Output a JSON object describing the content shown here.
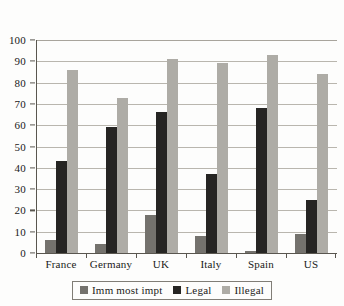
{
  "chart_data": {
    "type": "bar",
    "title": "",
    "subtitle": "",
    "xlabel": "",
    "ylabel": "",
    "categories": [
      "France",
      "Germany",
      "UK",
      "Italy",
      "Spain",
      "US"
    ],
    "series": [
      {
        "name": "Imm most impt",
        "color": "#74726d",
        "values": [
          6,
          4,
          18,
          8,
          1,
          9
        ]
      },
      {
        "name": "Legal",
        "color": "#262523",
        "values": [
          43,
          59,
          66,
          37,
          68,
          25
        ]
      },
      {
        "name": "Illegal",
        "color": "#aeaca6",
        "values": [
          86,
          73,
          91,
          89,
          93,
          84
        ]
      }
    ],
    "ylim": [
      0,
      100
    ],
    "yticks": [
      0,
      10,
      20,
      30,
      40,
      50,
      60,
      70,
      80,
      90,
      100
    ],
    "ytick_labels": [
      "0",
      "10",
      "20",
      "30",
      "40",
      "50",
      "60",
      "70",
      "80",
      "90",
      "100"
    ],
    "grid": true,
    "grid_axis": "y",
    "legend_position": "bottom-center",
    "bar_group_order": [
      "Imm most impt",
      "Legal",
      "Illegal"
    ]
  },
  "legend": {
    "items": [
      {
        "label": "Imm most impt"
      },
      {
        "label": "Legal"
      },
      {
        "label": "Illegal"
      }
    ]
  },
  "colors": {
    "series_imm_most_impt": "#74726d",
    "series_legal": "#262523",
    "series_illegal": "#aeaca6",
    "axis": "#59564f",
    "grid": "#b9b6ae",
    "background": "#fdfdfc",
    "text": "#1a1a18"
  }
}
